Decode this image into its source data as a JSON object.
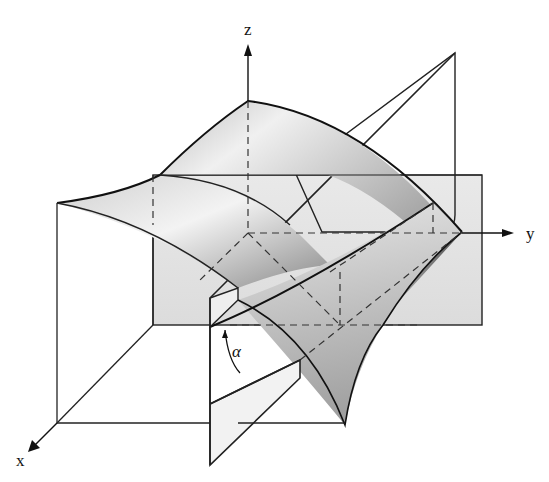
{
  "diagram": {
    "axes": {
      "x_label": "x",
      "y_label": "y",
      "z_label": "z"
    },
    "angle_label": "α",
    "colors": {
      "line": "#1a1a1a",
      "plane_fill": "#e6e6e6",
      "surface_light": "#f2f2f2",
      "surface_mid": "#bdbdbd",
      "surface_dark": "#6e6e6e"
    }
  }
}
